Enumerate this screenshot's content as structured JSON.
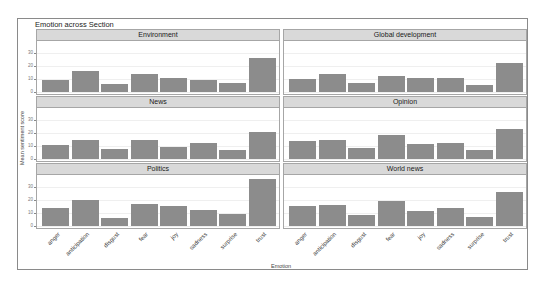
{
  "chart_data": {
    "type": "bar",
    "title": "Emotion across Section",
    "xlabel": "Emotion",
    "ylabel": "Mean sentiment score",
    "ylim": [
      0,
      38
    ],
    "yticks": [
      0,
      10,
      20,
      30
    ],
    "grid": true,
    "facet_layout": {
      "rows": 3,
      "cols": 2
    },
    "categories": [
      "anger",
      "anticipation",
      "disgust",
      "fear",
      "joy",
      "sadness",
      "surprise",
      "trust"
    ],
    "series": [
      {
        "name": "Environment",
        "values": [
          9.5,
          16,
          6,
          13.5,
          11,
          9.5,
          6.5,
          26
        ]
      },
      {
        "name": "Global development",
        "values": [
          10,
          13.5,
          6.5,
          12.5,
          11,
          11,
          5.5,
          22
        ]
      },
      {
        "name": "News",
        "values": [
          11,
          14.5,
          7.5,
          14.5,
          9.5,
          12,
          6.5,
          20.5
        ]
      },
      {
        "name": "Opinion",
        "values": [
          14,
          14.5,
          8.5,
          18,
          11.5,
          12.5,
          7,
          23
        ]
      },
      {
        "name": "Politics",
        "values": [
          13.5,
          20,
          6,
          17,
          15.5,
          12,
          9,
          35.5
        ]
      },
      {
        "name": "World news",
        "values": [
          15.5,
          16,
          8.5,
          19,
          11.5,
          13.5,
          7,
          26
        ]
      }
    ]
  },
  "colors": {
    "bar": "#8c8c8c",
    "strip": "#d9d9d9",
    "border": "#a6a6a6"
  }
}
